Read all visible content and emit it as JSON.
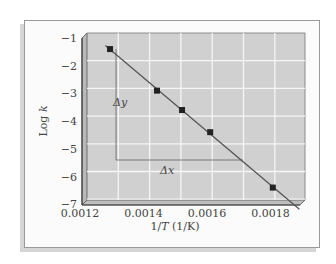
{
  "chart_data": {
    "type": "scatter",
    "title": "",
    "xlabel": "1/T (1/K)",
    "ylabel": "Log k",
    "xlim": [
      0.0012,
      0.00188
    ],
    "ylim": [
      -7,
      -1
    ],
    "x_ticks": [
      "0.0012",
      "0.0014",
      "0.0016",
      "0.0018"
    ],
    "y_ticks": [
      "−1",
      "−2",
      "−3",
      "−4",
      "−5",
      "−6",
      "−7"
    ],
    "grid": true,
    "series": [
      {
        "name": "data",
        "x": [
          0.00128,
          0.00143,
          0.00151,
          0.0016,
          0.0018
        ],
        "y": [
          -1.4,
          -2.9,
          -3.6,
          -4.4,
          -6.4
        ],
        "marker": "square",
        "fit_line": true
      }
    ],
    "annotations": [
      {
        "text": "Δy",
        "meaning": "vertical change"
      },
      {
        "text": "Δx",
        "meaning": "horizontal change"
      }
    ],
    "colors": {
      "plot_bg": "#cfcfcf",
      "grid": "#f4f4f4",
      "line": "#555555",
      "marker": "#222222"
    }
  },
  "labels": {
    "xlabel_prefix": "1/",
    "xlabel_var": "T",
    "xlabel_unit": " (1/K)",
    "ylabel_text": "Log ",
    "ylabel_var": "k",
    "dy": "Δy",
    "dx": "Δx"
  }
}
